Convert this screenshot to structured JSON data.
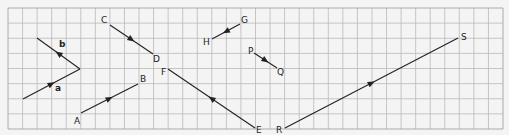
{
  "diagram": {
    "title": "",
    "background": "#f4f4f4",
    "grid": {
      "x0": 8,
      "y0": 8,
      "x1": 503,
      "y1": 129,
      "cols": 34,
      "rows": 8,
      "color": "#b9b9b9",
      "border_color": "#9a9a9a"
    },
    "line_color": "#222222",
    "vectors": [
      {
        "id": "a",
        "from": [
          23,
          99
        ],
        "to": [
          80,
          69
        ],
        "arrow_dir": "forward",
        "label": "a",
        "label_pos": [
          55,
          91
        ],
        "bold": true
      },
      {
        "id": "b",
        "from": [
          80,
          69
        ],
        "to": [
          37,
          38
        ],
        "arrow_dir": "forward",
        "label": "b",
        "label_pos": [
          59,
          47
        ],
        "bold": true
      },
      {
        "id": "CD",
        "from": [
          110,
          25
        ],
        "to": [
          153,
          54
        ],
        "arrow_dir": "forward"
      },
      {
        "id": "AB",
        "from": [
          81,
          113
        ],
        "to": [
          138,
          84
        ],
        "arrow_dir": "forward"
      },
      {
        "id": "FE",
        "from": [
          255,
          128
        ],
        "to": [
          168,
          69
        ],
        "arrow_dir": "forward"
      },
      {
        "id": "GH",
        "from": [
          240,
          24
        ],
        "to": [
          212,
          39
        ],
        "arrow_dir": "forward"
      },
      {
        "id": "PQ",
        "from": [
          254,
          53
        ],
        "to": [
          277,
          68
        ],
        "arrow_dir": "forward"
      },
      {
        "id": "RS",
        "from": [
          285,
          128
        ],
        "to": [
          458,
          38
        ],
        "arrow_dir": "forward"
      }
    ],
    "points": [
      {
        "label": "A",
        "pos": [
          74,
          124
        ]
      },
      {
        "label": "B",
        "pos": [
          140,
          82
        ]
      },
      {
        "label": "C",
        "pos": [
          101,
          23
        ]
      },
      {
        "label": "D",
        "pos": [
          153,
          62
        ]
      },
      {
        "label": "E",
        "pos": [
          256,
          133
        ]
      },
      {
        "label": "F",
        "pos": [
          161,
          75
        ]
      },
      {
        "label": "G",
        "pos": [
          241,
          23
        ]
      },
      {
        "label": "H",
        "pos": [
          203,
          45
        ]
      },
      {
        "label": "P",
        "pos": [
          248,
          54
        ]
      },
      {
        "label": "Q",
        "pos": [
          277,
          75
        ]
      },
      {
        "label": "R",
        "pos": [
          276,
          133
        ]
      },
      {
        "label": "S",
        "pos": [
          461,
          40
        ]
      }
    ]
  }
}
